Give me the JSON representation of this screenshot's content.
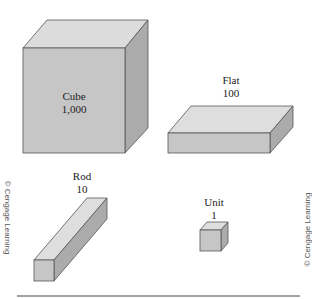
{
  "blocks": [
    {
      "name": "Cube",
      "value": "1,000"
    },
    {
      "name": "Flat",
      "value": "100"
    },
    {
      "name": "Rod",
      "value": "10"
    },
    {
      "name": "Unit",
      "value": "1"
    }
  ],
  "credits": {
    "left": "© Cengage Learning",
    "right": "© Cengage Learning"
  },
  "colors": {
    "front": "#c4c4c4",
    "top": "#dedede",
    "side": "#a9a9a9",
    "edge": "#555555"
  }
}
